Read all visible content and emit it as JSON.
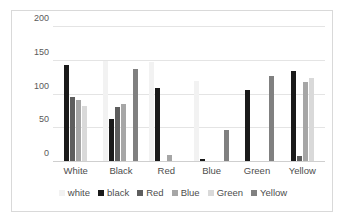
{
  "chart_data": {
    "type": "bar",
    "title": "",
    "subtitle": "",
    "xlabel": "",
    "ylabel": "",
    "categories": [
      "White",
      "Black",
      "Red",
      "Blue",
      "Green",
      "Yellow"
    ],
    "series": [
      {
        "name": "white",
        "color": "#f2f2f2",
        "values": [
          0,
          150,
          148,
          120,
          0,
          0
        ]
      },
      {
        "name": "black",
        "color": "#1a1a1a",
        "values": [
          143,
          64,
          110,
          5,
          107,
          135
        ]
      },
      {
        "name": "Red",
        "color": "#5e5e5e",
        "values": [
          96,
          82,
          0,
          0,
          0,
          9
        ]
      },
      {
        "name": "Blue",
        "color": "#a6a6a6",
        "values": [
          92,
          86,
          11,
          0,
          0,
          119
        ]
      },
      {
        "name": "Green",
        "color": "#d9d9d9",
        "values": [
          83,
          0,
          0,
          0,
          0,
          125
        ]
      },
      {
        "name": "Yellow",
        "color": "#808080",
        "values": [
          0,
          138,
          0,
          48,
          127,
          0
        ]
      }
    ],
    "ylim": [
      0,
      200
    ],
    "yticks": [
      0,
      50,
      100,
      150,
      200
    ],
    "ytick_labels": [
      "0",
      "50",
      "100",
      "150",
      "200"
    ],
    "grid": true,
    "grid_color": "#e4e4e4",
    "legend_position": "bottom",
    "plot_background": "#ffffff",
    "border_color": "#d9d9d9"
  }
}
